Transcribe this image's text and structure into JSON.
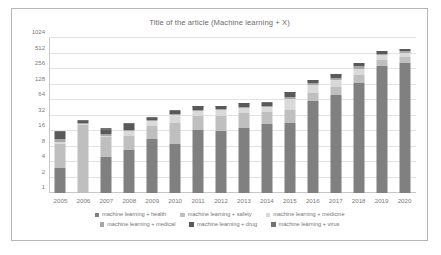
{
  "chart_data": {
    "type": "bar",
    "title": "Title of the article (Machine learning + X)",
    "xlabel": "",
    "ylabel": "",
    "stacked": true,
    "yscale": "log2",
    "ylim": [
      1,
      1024
    ],
    "yticks": [
      "1024",
      "512",
      "256",
      "128",
      "64",
      "32",
      "16",
      "8",
      "4",
      "2",
      "1"
    ],
    "grid": true,
    "legend_position": "bottom",
    "categories": [
      "2005",
      "2006",
      "2007",
      "2008",
      "2009",
      "2010",
      "2011",
      "2012",
      "2013",
      "2014",
      "2015",
      "2016",
      "2017",
      "2018",
      "2019",
      "2020"
    ],
    "series": [
      {
        "name": "machine learning + health",
        "color": "#808080",
        "values": [
          3,
          1,
          5,
          7,
          11,
          9,
          17,
          16,
          18,
          22,
          23,
          62,
          80,
          140,
          290,
          330
        ]
      },
      {
        "name": "machine learning + safety",
        "color": "#bfbfbf",
        "values": [
          6,
          20,
          7,
          6,
          9,
          14,
          14,
          16,
          18,
          15,
          18,
          26,
          35,
          60,
          100,
          110
        ]
      },
      {
        "name": "machine learning + medicine",
        "color": "#d9d9d9",
        "values": [
          1,
          1,
          1,
          3,
          5,
          10,
          9,
          9,
          9,
          10,
          25,
          35,
          40,
          60,
          80,
          90
        ]
      },
      {
        "name": "machine learning + medical",
        "color": "#a6a6a6",
        "values": [
          1,
          1,
          1,
          1,
          1,
          1,
          1,
          1,
          1,
          1,
          8,
          12,
          18,
          28,
          40,
          45
        ]
      },
      {
        "name": "machine learning + drug",
        "color": "#595959",
        "values": [
          4,
          2,
          3,
          5,
          3,
          6,
          8,
          7,
          9,
          9,
          17,
          20,
          28,
          40,
          55,
          60
        ]
      },
      {
        "name": "machine learning + virus",
        "color": "#737373",
        "values": [
          1,
          1,
          1,
          1,
          1,
          1,
          1,
          1,
          1,
          1,
          1,
          1,
          1,
          1,
          1,
          1
        ]
      }
    ],
    "totals": [
      14,
      24,
      17,
      22,
      30,
      41,
      50,
      50,
      56,
      58,
      92,
      156,
      202,
      329,
      566,
      636
    ]
  },
  "legend": {
    "rows": [
      [
        {
          "label": "machine learning + health",
          "color": "#808080"
        },
        {
          "label": "machine learning + safety",
          "color": "#bfbfbf"
        },
        {
          "label": "machine learning + medicine",
          "color": "#d9d9d9"
        }
      ],
      [
        {
          "label": "machine learning + medical",
          "color": "#a6a6a6"
        },
        {
          "label": "machine learning + drug",
          "color": "#595959"
        },
        {
          "label": "machine learning + virus",
          "color": "#737373"
        }
      ]
    ]
  }
}
